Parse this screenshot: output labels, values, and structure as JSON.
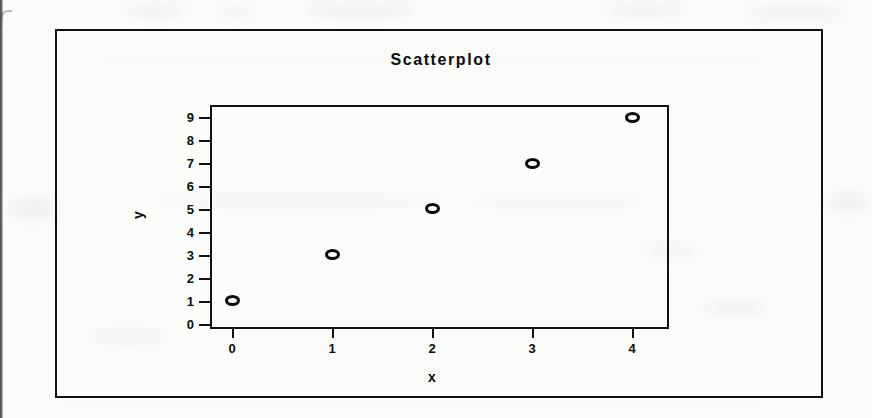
{
  "chart_data": {
    "type": "scatter",
    "title": "Scatterplot",
    "xlabel": "x",
    "ylabel": "y",
    "x": [
      0,
      1,
      2,
      3,
      4
    ],
    "y": [
      1,
      3,
      5,
      7,
      9
    ],
    "points": [
      {
        "x": 0,
        "y": 1
      },
      {
        "x": 1,
        "y": 3
      },
      {
        "x": 2,
        "y": 5
      },
      {
        "x": 3,
        "y": 7
      },
      {
        "x": 4,
        "y": 9
      }
    ],
    "xlim": [
      -0.2,
      4.35
    ],
    "ylim": [
      -0.15,
      9.45
    ],
    "xticks": [
      0,
      1,
      2,
      3,
      4
    ],
    "yticks": [
      0,
      1,
      2,
      3,
      4,
      5,
      6,
      7,
      8,
      9
    ],
    "xtick_labels": [
      "0",
      "1",
      "2",
      "3",
      "4"
    ],
    "ytick_labels": [
      "0",
      "1",
      "2",
      "3",
      "4",
      "5",
      "6",
      "7",
      "8",
      "9"
    ],
    "grid": false,
    "legend": false,
    "legend_position": "none",
    "marker": "open-circle",
    "marker_color": "#0a0a0a",
    "frame_color": "#111111",
    "background_color": "#fbfbfa"
  },
  "figure": {
    "border_color": "#111111",
    "outer_box": true
  }
}
